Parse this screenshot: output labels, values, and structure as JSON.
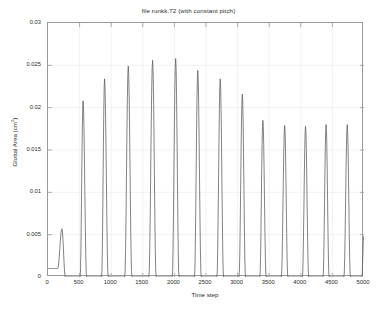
{
  "figure": {
    "title": "file runkk.72 (with constant pitch)",
    "background_color": "#ffffff",
    "axes_color": "#9a9a9a",
    "grid_color": "#ededed",
    "line_color": "#5a5a5a"
  },
  "axis": {
    "x_label": "Time step",
    "y_label_main": "Glottal Area (cm",
    "y_label_sup": "2",
    "y_label_tail": ")",
    "x_ticks": [
      "0",
      "500",
      "1000",
      "1500",
      "2000",
      "2500",
      "3000",
      "3500",
      "4000",
      "4500",
      "5000"
    ],
    "y_ticks": [
      "0.03",
      "0.025",
      "0.02",
      "0.015",
      "0.01",
      "0.005",
      "0"
    ]
  },
  "chart_data": {
    "type": "line",
    "title": "file runkk.72 (with constant pitch)",
    "xlabel": "Time step",
    "ylabel": "Glottal Area (cm^2)",
    "xlim": [
      0,
      5000
    ],
    "ylim": [
      0,
      0.03
    ],
    "xticks": [
      0,
      500,
      1000,
      1500,
      2000,
      2500,
      3000,
      3500,
      4000,
      4500,
      5000
    ],
    "yticks": [
      0,
      0.005,
      0.01,
      0.015,
      0.02,
      0.025,
      0.03
    ],
    "grid": true,
    "legend": null,
    "series": [
      {
        "name": "glottal area",
        "description": "Quasi-periodic glottal area pulses; onset transient then steady oscillation of period ~340 time steps.",
        "peaks": [
          {
            "x": 220,
            "y": 0.0057
          },
          {
            "x": 555,
            "y": 0.0208
          },
          {
            "x": 895,
            "y": 0.0234
          },
          {
            "x": 1270,
            "y": 0.0249
          },
          {
            "x": 1655,
            "y": 0.0256
          },
          {
            "x": 2020,
            "y": 0.0258
          },
          {
            "x": 2370,
            "y": 0.0244
          },
          {
            "x": 2725,
            "y": 0.0234
          },
          {
            "x": 3075,
            "y": 0.0216
          },
          {
            "x": 3400,
            "y": 0.0185
          },
          {
            "x": 3745,
            "y": 0.0179
          },
          {
            "x": 4075,
            "y": 0.0178
          },
          {
            "x": 4400,
            "y": 0.018
          },
          {
            "x": 4735,
            "y": 0.018
          },
          {
            "x": 4995,
            "y": 0.0048
          }
        ],
        "troughs": [
          {
            "x": 0,
            "y": 0.001
          },
          {
            "x": 400,
            "y": 0.0
          },
          {
            "x": 740,
            "y": 0.0
          },
          {
            "x": 1085,
            "y": 0.0
          },
          {
            "x": 1460,
            "y": 0.0
          },
          {
            "x": 1840,
            "y": 0.0
          },
          {
            "x": 2195,
            "y": 0.0
          },
          {
            "x": 2550,
            "y": 0.0
          },
          {
            "x": 2900,
            "y": 0.0
          },
          {
            "x": 3240,
            "y": 0.0
          },
          {
            "x": 3570,
            "y": 0.0
          },
          {
            "x": 3910,
            "y": 0.0
          },
          {
            "x": 4240,
            "y": 0.0
          },
          {
            "x": 4560,
            "y": 0.0
          },
          {
            "x": 4900,
            "y": 0.0
          },
          {
            "x": 5000,
            "y": 0.0048
          }
        ],
        "pulse_half_width_fraction": 0.3
      }
    ]
  }
}
